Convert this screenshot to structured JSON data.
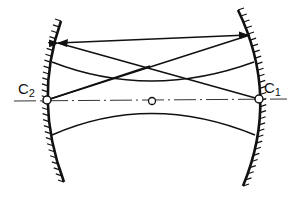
{
  "diagram": {
    "type": "optical resonator (two concave mirrors)",
    "labels": {
      "c2_main": "C",
      "c2_sub": "2",
      "c1_main": "C",
      "c1_sub": "1"
    },
    "points": {
      "C2": [
        47,
        100
      ],
      "C1": [
        259,
        99
      ],
      "center": [
        152,
        101
      ]
    },
    "elements": [
      "left-concave-mirror",
      "right-concave-mirror",
      "optical-axis (dash-dot)",
      "double-headed ray between mirrors",
      "crossing rays",
      "upper beam curve",
      "lower beam curve"
    ],
    "colors": {
      "stroke": "#111111",
      "axis": "#333333",
      "background": "#ffffff"
    }
  }
}
